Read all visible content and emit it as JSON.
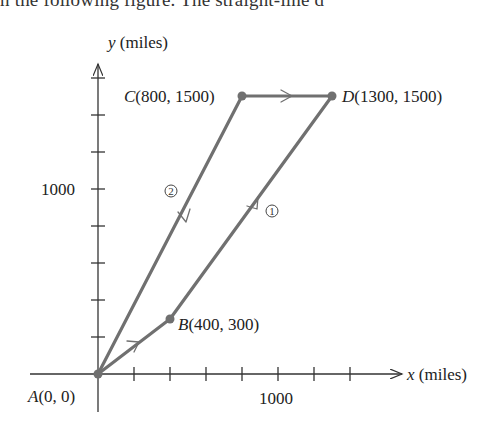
{
  "header": {
    "clipped_text": "n the following figure. The straight-line d"
  },
  "axes": {
    "x_label_var": "x",
    "x_label_unit": " (miles)",
    "y_label_var": "y",
    "y_label_unit": " (miles)",
    "x_tick_label": "1000",
    "y_tick_label": "1000",
    "x_tick_step": 200,
    "y_tick_step": 200
  },
  "points": [
    {
      "name": "A",
      "coords": "(0, 0)",
      "x": 0,
      "y": 0
    },
    {
      "name": "B",
      "coords": "(400, 300)",
      "x": 400,
      "y": 300
    },
    {
      "name": "C",
      "coords": "(800, 1500)",
      "x": 800,
      "y": 1500
    },
    {
      "name": "D",
      "coords": "(1300, 1500)",
      "x": 1300,
      "y": 1500
    }
  ],
  "routes": [
    {
      "id": "route-1",
      "label": "1",
      "path": [
        "A",
        "B",
        "D"
      ]
    },
    {
      "id": "route-2",
      "label": "2",
      "path": [
        "A",
        "C",
        "D"
      ]
    }
  ],
  "colors": {
    "path": "#707070",
    "axis": "#333333",
    "text": "#222222"
  }
}
